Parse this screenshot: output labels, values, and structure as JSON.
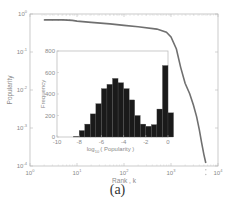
{
  "caption": "(a)",
  "chart_data": [
    {
      "type": "line",
      "role": "main",
      "title": "",
      "xlabel": "Rank , k",
      "ylabel": "Popularity",
      "xscale": "log",
      "yscale": "log",
      "xlim": [
        1,
        10000
      ],
      "ylim": [
        0.0001,
        1
      ],
      "x_tick_labels": [
        "10^0",
        "10^1",
        "10^2",
        "10^3",
        "10^4"
      ],
      "y_tick_labels": [
        "10^0",
        "10^-1",
        "10^-2",
        "10^-3",
        "10^-4"
      ],
      "series": [
        {
          "name": "popularity vs rank",
          "color": "#707070",
          "x": [
            2,
            3,
            5,
            8,
            10,
            20,
            50,
            100,
            200,
            500,
            800,
            1000,
            1300,
            1600,
            2000,
            2500,
            3000,
            3500,
            4000,
            4500,
            5000,
            5500
          ],
          "y": [
            0.7,
            0.7,
            0.7,
            0.68,
            0.65,
            0.6,
            0.55,
            0.5,
            0.46,
            0.4,
            0.33,
            0.25,
            0.12,
            0.04,
            0.015,
            0.008,
            0.004,
            0.002,
            0.0009,
            0.0004,
            0.0002,
            0.00012
          ]
        }
      ]
    },
    {
      "type": "bar",
      "role": "inset histogram",
      "title": "",
      "xlabel": "log10 ( Popularity )",
      "ylabel": "Frequency",
      "xlim": [
        -10,
        0
      ],
      "ylim": [
        0,
        800
      ],
      "x_tick_labels": [
        "-10",
        "-8",
        "-6",
        "-4",
        "-2",
        "0"
      ],
      "y_tick_labels": [
        "0",
        "200",
        "400",
        "600",
        "800"
      ],
      "bar_color": "#1a1a1a",
      "bin_width": 0.5,
      "categories": [
        -8.5,
        -8.0,
        -7.5,
        -7.0,
        -6.5,
        -6.0,
        -5.5,
        -5.0,
        -4.5,
        -4.0,
        -3.5,
        -3.0,
        -2.5,
        -2.0,
        -1.5,
        -1.0,
        -0.5
      ],
      "values": [
        5,
        60,
        120,
        215,
        310,
        450,
        490,
        545,
        505,
        450,
        345,
        200,
        120,
        100,
        115,
        260,
        665,
        225
      ]
    }
  ],
  "labels": {
    "main_x": "Rank , k",
    "main_y": "Popularity",
    "inset_x_prefix": "log",
    "inset_x_sub": "10",
    "inset_x_rest": "( Popularity )",
    "inset_y": "Frequency"
  }
}
